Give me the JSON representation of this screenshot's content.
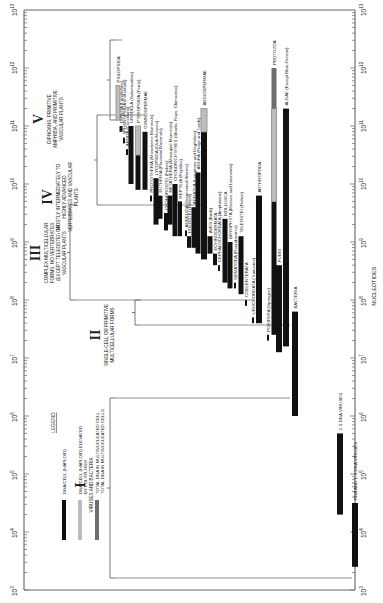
{
  "chart_data": {
    "type": "bar",
    "orientation": "rotated-90-ccw (log axis vertical, taxa as columns)",
    "title": "",
    "xlabel": "NUCLEOTIDES",
    "ylabel": "",
    "axis": {
      "scale": "log10",
      "range_exponents": [
        3,
        13
      ],
      "tick_labels": [
        "10^3",
        "10^4",
        "10^5",
        "10^6",
        "10^7",
        "10^8",
        "10^9",
        "10^10",
        "10^11",
        "10^12",
        "10^13"
      ]
    },
    "legend": {
      "title": "LEGEND",
      "entries": [
        {
          "key": "haploid",
          "label": "DNA/CELL (HAPLOID)",
          "color": "#111111"
        },
        {
          "key": "polyploid",
          "label": "DNA/CELL (HAPLOID) ELEVATED BY POLYPLOIDY",
          "color": "#bdbdbd"
        },
        {
          "key": "multinucleate",
          "label": "TOTAL DNA IN MULTINUCLEATED CELLS",
          "color": "#6e6e6e"
        }
      ]
    },
    "groups": [
      {
        "numeral": "I",
        "label": "VIRUSES AND BACTERIA"
      },
      {
        "numeral": "II",
        "label": "SINGLE-CELL OR PRIMITIVE MULTICELLULAR FORMS"
      },
      {
        "numeral": "III",
        "label": "COMPLEX MULTICELLULAR FORMS, NO VERTEBRATES (EXCEPT TELEOSTEI) OR VASCULAR PLANTS"
      },
      {
        "numeral": "IV",
        "label": "MOSTLY INTERMEDIATELY TO HIGHLY ADVANCED VERTEBRATES AND VASCULAR PLANTS"
      },
      {
        "numeral": "V",
        "label": "DIPNOANS, PRIMITIVE AMPHIBIA, AND PRIMITIVE VASCULAR PLANTS"
      }
    ],
    "series": [
      {
        "name": "PSILOPSIDA",
        "group": "V",
        "segments": [
          {
            "type": "polyploid",
            "from": 11.1,
            "to": 11.7
          }
        ]
      },
      {
        "name": "DIPNOA (Lungfishes)",
        "group": "V",
        "segments": [
          {
            "type": "haploid",
            "from": 10.9,
            "to": 11.0
          }
        ]
      },
      {
        "name": "SPHENOPSIDA (Horsetails)",
        "group": "V",
        "segments": [
          {
            "type": "haploid",
            "from": 10.7,
            "to": 10.8
          }
        ]
      },
      {
        "name": "APODA (Caecilians)",
        "group": "V",
        "segments": [
          {
            "type": "haploid",
            "from": 10.5,
            "to": 10.6
          }
        ]
      },
      {
        "name": "URODELA (Salamanders)",
        "group": "V",
        "segments": [
          {
            "type": "haploid",
            "from": 10.0,
            "to": 11.0
          }
        ]
      },
      {
        "name": "PTEROPSIDA (Ferns)",
        "group": "V",
        "segments": [
          {
            "type": "haploid",
            "from": 9.9,
            "to": 10.5
          },
          {
            "type": "polyploid",
            "from": 10.5,
            "to": 11.0
          }
        ]
      },
      {
        "name": "GYMNOSPERMAE",
        "group": "IV",
        "segments": [
          {
            "type": "haploid",
            "from": 9.9,
            "to": 10.9
          }
        ]
      },
      {
        "name": "PROTOTHERIA (Monotreme Mammals)",
        "group": "IV",
        "segments": [
          {
            "type": "haploid",
            "from": 9.7,
            "to": 9.8
          }
        ]
      },
      {
        "name": "LYCOPSIDA (Club-Mosses)",
        "group": "IV",
        "segments": [
          {
            "type": "haploid",
            "from": 9.3,
            "to": 10.1
          }
        ]
      },
      {
        "name": "EUTHERIA (Placental Mammals)",
        "group": "IV",
        "segments": [
          {
            "type": "haploid",
            "from": 9.4,
            "to": 9.8
          }
        ]
      },
      {
        "name": "CHONDROSTEI (Fishes)",
        "group": "IV",
        "segments": [
          {
            "type": "haploid",
            "from": 9.2,
            "to": 9.5
          }
        ]
      },
      {
        "name": "METATHERIA (Marsupial Mammals)",
        "group": "IV",
        "segments": [
          {
            "type": "haploid",
            "from": 9.3,
            "to": 9.8
          }
        ]
      },
      {
        "name": "CHONDRICHTHYES (Sharks, Rays, Chimaeras)",
        "group": "IV",
        "segments": [
          {
            "type": "haploid",
            "from": 9.1,
            "to": 10.0
          }
        ]
      },
      {
        "name": "REPTILIA (Reptiles)",
        "group": "IV",
        "segments": [
          {
            "type": "haploid",
            "from": 9.1,
            "to": 9.7
          }
        ]
      },
      {
        "name": "ANNELIDA (Segmented Worms)",
        "group": "IV",
        "segments": [
          {
            "type": "haploid",
            "from": 9.1,
            "to": 9.2
          }
        ]
      },
      {
        "name": "HOLOSTEI (Fishes)",
        "group": "IV",
        "segments": [
          {
            "type": "haploid",
            "from": 8.9,
            "to": 9.1
          }
        ]
      },
      {
        "name": "AGNATHA (Lampreys and Hagfishes)",
        "group": "IV",
        "segments": [
          {
            "type": "haploid",
            "from": 8.9,
            "to": 9.6
          }
        ]
      },
      {
        "name": "ANURA (Frogs and Toads)",
        "group": "IV",
        "segments": [
          {
            "type": "haploid",
            "from": 8.8,
            "to": 10.2
          }
        ]
      },
      {
        "name": "ANGIOSPERMAE",
        "group": "IV",
        "segments": [
          {
            "type": "haploid",
            "from": 8.7,
            "to": 10.9
          },
          {
            "type": "polyploid",
            "from": 10.9,
            "to": 11.3
          }
        ]
      },
      {
        "name": "AVES (Birds)",
        "group": "IV",
        "segments": [
          {
            "type": "haploid",
            "from": 8.8,
            "to": 9.1
          }
        ]
      },
      {
        "name": "ECHINODERMATA",
        "group": "III",
        "segments": [
          {
            "type": "haploid",
            "from": 8.6,
            "to": 8.8
          }
        ]
      },
      {
        "name": "CEPHALOCHORDATA (Amphioxus)",
        "group": "III",
        "segments": [
          {
            "type": "haploid",
            "from": 8.5,
            "to": 8.6
          }
        ]
      },
      {
        "name": "MOLLUSCA",
        "group": "III",
        "segments": [
          {
            "type": "haploid",
            "from": 8.3,
            "to": 9.4
          }
        ]
      },
      {
        "name": "BRYOPHYTA (Mosses and Liverworts)",
        "group": "III",
        "segments": [
          {
            "type": "haploid",
            "from": 8.2,
            "to": 9.0
          }
        ]
      },
      {
        "name": "NEMATODA (Roundworms)",
        "group": "III",
        "segments": [
          {
            "type": "haploid",
            "from": 8.2,
            "to": 8.3
          }
        ]
      },
      {
        "name": "TELEOSTEI (Fishes)",
        "group": "III",
        "segments": [
          {
            "type": "haploid",
            "from": 8.1,
            "to": 9.1
          }
        ]
      },
      {
        "name": "COELENTERATA",
        "group": "III",
        "segments": [
          {
            "type": "haploid",
            "from": 7.9,
            "to": 8.0
          }
        ]
      },
      {
        "name": "UROCHORDATA (Tunicates)",
        "group": "III",
        "segments": [
          {
            "type": "haploid",
            "from": 7.6,
            "to": 7.7
          }
        ]
      },
      {
        "name": "ARTHROPODA",
        "group": "III",
        "segments": [
          {
            "type": "haploid",
            "from": 7.6,
            "to": 9.8
          }
        ]
      },
      {
        "name": "PORIFERA (Sponges)",
        "group": "II",
        "segments": [
          {
            "type": "haploid",
            "from": 7.3,
            "to": 7.4
          }
        ]
      },
      {
        "name": "PROTOZOA",
        "group": "II",
        "segments": [
          {
            "type": "haploid",
            "from": 7.4,
            "to": 9.7
          },
          {
            "type": "polyploid",
            "from": 9.7,
            "to": 11.3
          },
          {
            "type": "multinucleate",
            "from": 11.3,
            "to": 12.0
          }
        ]
      },
      {
        "name": "FUNGI",
        "group": "II",
        "segments": [
          {
            "type": "haploid",
            "from": 7.1,
            "to": 8.6
          }
        ]
      },
      {
        "name": "ALGAE (Except Blue-Greens)",
        "group": "II",
        "segments": [
          {
            "type": "haploid",
            "from": 7.2,
            "to": 11.3
          }
        ]
      },
      {
        "name": "BACTERIA",
        "group": "I",
        "segments": [
          {
            "type": "haploid",
            "from": 6.0,
            "to": 7.8
          }
        ]
      },
      {
        "name": "2-S DNA VIRUSES",
        "group": "I",
        "segments": [
          {
            "type": "haploid",
            "from": 4.3,
            "to": 5.7
          }
        ]
      },
      {
        "name": "RNA AND 1-S DNA VIRUSES",
        "group": "I",
        "segments": [
          {
            "type": "haploid",
            "from": 3.4,
            "to": 4.5
          }
        ]
      }
    ]
  },
  "ui": {
    "axis_tick_base": "10",
    "xlabel": "NUCLEOTIDES",
    "legend_title": "LEGEND"
  }
}
